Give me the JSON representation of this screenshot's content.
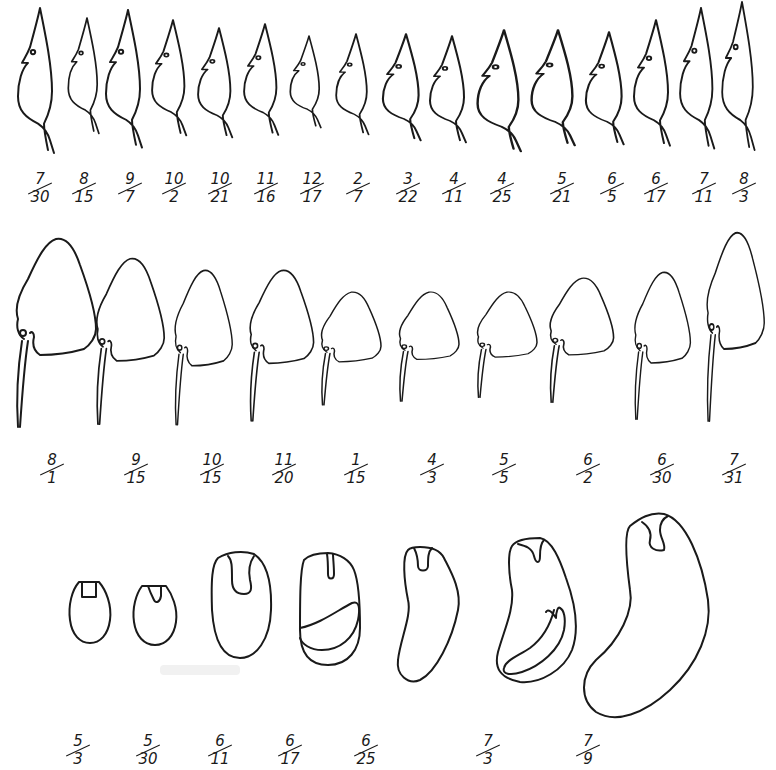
{
  "figure": {
    "line_color": "#1a1a1a",
    "background": "#ffffff"
  },
  "rows": [
    {
      "name": "row-1-bird-shaped-forms",
      "labels": [
        {
          "num": "7",
          "den": "30"
        },
        {
          "num": "8",
          "den": "15"
        },
        {
          "num": "9",
          "den": "7"
        },
        {
          "num": "10",
          "den": "2"
        },
        {
          "num": "10",
          "den": "21"
        },
        {
          "num": "11",
          "den": "16"
        },
        {
          "num": "12",
          "den": "17"
        },
        {
          "num": "2",
          "den": "7"
        },
        {
          "num": "3",
          "den": "22"
        },
        {
          "num": "4",
          "den": "11"
        },
        {
          "num": "4",
          "den": "25"
        },
        {
          "num": "5",
          "den": "21"
        },
        {
          "num": "6",
          "den": "5"
        },
        {
          "num": "6",
          "den": "17"
        },
        {
          "num": "7",
          "den": "11"
        },
        {
          "num": "8",
          "den": "3"
        }
      ]
    },
    {
      "name": "row-2-beaked-forms",
      "labels": [
        {
          "num": "8",
          "den": "1"
        },
        {
          "num": "9",
          "den": "15"
        },
        {
          "num": "10",
          "den": "15"
        },
        {
          "num": "11",
          "den": "20"
        },
        {
          "num": "1",
          "den": "15"
        },
        {
          "num": "4",
          "den": "3"
        },
        {
          "num": "5",
          "den": "5"
        },
        {
          "num": "6",
          "den": "2"
        },
        {
          "num": "6",
          "den": "30"
        },
        {
          "num": "7",
          "den": "31"
        }
      ]
    },
    {
      "name": "row-3-seed-forms",
      "labels": [
        {
          "num": "5",
          "den": "3"
        },
        {
          "num": "5",
          "den": "30"
        },
        {
          "num": "6",
          "den": "11"
        },
        {
          "num": "6",
          "den": "17"
        },
        {
          "num": "6",
          "den": "25"
        },
        {
          "num": "7",
          "den": "3"
        },
        {
          "num": "7",
          "den": "9"
        }
      ]
    }
  ]
}
